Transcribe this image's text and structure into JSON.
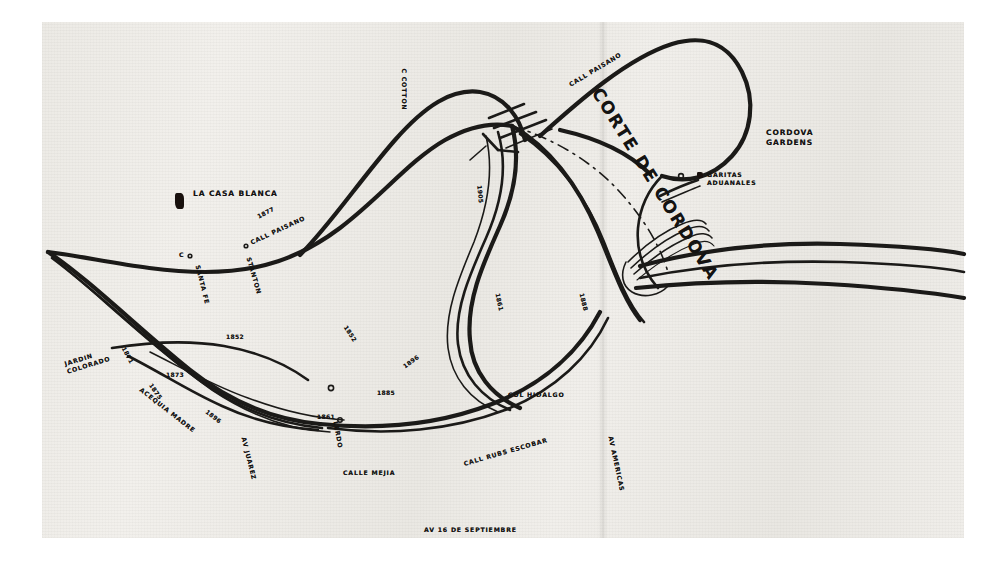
{
  "document": {
    "kind": "scanned-historical-map",
    "title_on_map": "CORTE DE CORDOVA",
    "background_color": "#eeece7",
    "ink_color": "#1b1a18",
    "page_color": "#ffffff"
  },
  "title_label": {
    "text": "CORTE DE CORDOVA",
    "x": 596,
    "y": 80,
    "rotate": 58
  },
  "place_labels": [
    {
      "name": "la-casa-blanca",
      "text": "LA CASA BLANCA",
      "x": 193,
      "y": 190,
      "rotate": 0,
      "size": "lbl-place"
    },
    {
      "name": "cordova-gardens",
      "text": "CORDOVA\nGARDENS",
      "x": 766,
      "y": 128,
      "rotate": 0,
      "size": "lbl-place"
    },
    {
      "name": "garitas-aduanales",
      "text": "GARITAS\nADUANALES",
      "x": 707,
      "y": 171,
      "rotate": 0,
      "size": "lbl-street"
    },
    {
      "name": "col-hidalgo",
      "text": "COL HIDALGO",
      "x": 508,
      "y": 392,
      "rotate": 0,
      "size": "lbl-street"
    },
    {
      "name": "jardin-colorado",
      "text": "JARDIN\nCOLORADO",
      "x": 66,
      "y": 360,
      "rotate": -17,
      "size": "lbl-street"
    }
  ],
  "street_labels": [
    {
      "name": "calle-cotton",
      "text": "C   COTTON",
      "x": 404,
      "y": 65,
      "rotate": 90
    },
    {
      "name": "calle-paisano-north",
      "text": "CALL PAISANO",
      "x": 570,
      "y": 82,
      "rotate": -31
    },
    {
      "name": "calle-paisano-west",
      "text": "CALL PAISANO",
      "x": 251,
      "y": 240,
      "rotate": -25
    },
    {
      "name": "calle-stanton",
      "text": "STANTON",
      "x": 248,
      "y": 254,
      "rotate": 74
    },
    {
      "name": "calle-santa-fe",
      "text": "SANTA FE",
      "x": 197,
      "y": 262,
      "rotate": 76
    },
    {
      "name": "calle-c",
      "text": "C",
      "x": 179,
      "y": 252,
      "rotate": 0
    },
    {
      "name": "acequia-madre",
      "text": "ACEQUIA MADRE",
      "x": 140,
      "y": 386,
      "rotate": 38
    },
    {
      "name": "avenida-juarez",
      "text": "AV  JUAREZ",
      "x": 243,
      "y": 434,
      "rotate": 76
    },
    {
      "name": "calle-lerdo",
      "text": "LERDO",
      "x": 335,
      "y": 418,
      "rotate": 80
    },
    {
      "name": "calle-mejia",
      "text": "CALLE  MEJIA",
      "x": 343,
      "y": 470,
      "rotate": 0
    },
    {
      "name": "calle-rubs-escobar",
      "text": "CALL RUBS ESCOBAR",
      "x": 464,
      "y": 461,
      "rotate": -16
    },
    {
      "name": "avenida-16-de-septiembre",
      "text": "AV 16 DE SEPTIEMBRE",
      "x": 424,
      "y": 527,
      "rotate": 0
    },
    {
      "name": "avenida-americas",
      "text": "AV AMERICAS",
      "x": 610,
      "y": 433,
      "rotate": 78
    }
  ],
  "year_labels": [
    {
      "name": "year-1877",
      "text": "1877",
      "x": 258,
      "y": 214,
      "rotate": -28
    },
    {
      "name": "year-1852-east",
      "text": "1852",
      "x": 345,
      "y": 323,
      "rotate": 57
    },
    {
      "name": "year-1852-west",
      "text": "1852",
      "x": 226,
      "y": 334,
      "rotate": 0
    },
    {
      "name": "year-1871",
      "text": "1871",
      "x": 123,
      "y": 344,
      "rotate": 62
    },
    {
      "name": "year-1873",
      "text": "1873",
      "x": 166,
      "y": 372,
      "rotate": 0
    },
    {
      "name": "year-1875",
      "text": "1875",
      "x": 150,
      "y": 381,
      "rotate": 55
    },
    {
      "name": "year-1896-west",
      "text": "1896",
      "x": 206,
      "y": 408,
      "rotate": 38
    },
    {
      "name": "year-1905",
      "text": "1905",
      "x": 479,
      "y": 182,
      "rotate": 85
    },
    {
      "name": "year-1861-mid",
      "text": "1861",
      "x": 497,
      "y": 290,
      "rotate": 78
    },
    {
      "name": "year-1896-mid",
      "text": "1896",
      "x": 404,
      "y": 364,
      "rotate": -36
    },
    {
      "name": "year-1885",
      "text": "1885",
      "x": 377,
      "y": 390,
      "rotate": 0
    },
    {
      "name": "year-1861-south",
      "text": "1861",
      "x": 317,
      "y": 414,
      "rotate": 0
    },
    {
      "name": "year-1888",
      "text": "1888",
      "x": 581,
      "y": 290,
      "rotate": 76
    }
  ],
  "symbols": [
    {
      "name": "casa-blanca-block",
      "x": 175,
      "y": 193,
      "w": 9,
      "h": 16
    },
    {
      "name": "garita-block",
      "x": 697,
      "y": 172,
      "w": 6,
      "h": 6
    }
  ]
}
